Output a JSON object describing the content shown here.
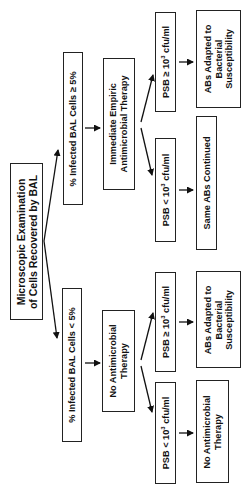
{
  "diagram": {
    "orientation": "rotated-90-ccw",
    "root": {
      "lines": [
        "Microscopic Examination",
        "of Cells Recovered by BAL"
      ]
    },
    "high_branch": {
      "criterion": "% Infected BAL Cells ≥ 5%",
      "action": {
        "lines": [
          "Immediate Empiric",
          "Antimicrobial Therapy"
        ]
      },
      "psb_high": {
        "prefix": "PSB ≥ 10",
        "exp": "3",
        "suffix": " cfu/ml"
      },
      "psb_high_outcome": {
        "lines": [
          "ABs Adapted to",
          "Bacterial",
          "Susceptibility"
        ]
      },
      "psb_low": {
        "prefix": "PSB < 10",
        "exp": "3",
        "suffix": " cfu/ml"
      },
      "psb_low_outcome": {
        "lines": [
          "Same ABs Continued"
        ]
      }
    },
    "low_branch": {
      "criterion": "% Infected BAL Cells < 5%",
      "action": {
        "lines": [
          "No Antimicrobial",
          "Therapy"
        ]
      },
      "psb_high": {
        "prefix": "PSB ≥ 10",
        "exp": "3",
        "suffix": " cfu/ml"
      },
      "psb_high_outcome": {
        "lines": [
          "ABs Adapted to",
          "Bacterial",
          "Susceptibility"
        ]
      },
      "psb_low": {
        "prefix": "PSB < 10",
        "exp": "3",
        "suffix": " cfu/ml"
      },
      "psb_low_outcome": {
        "lines": [
          "No Antimicrobial",
          "Therapy"
        ]
      }
    },
    "colors": {
      "stroke": "#222222",
      "text": "#111111",
      "background": "#ffffff"
    }
  }
}
